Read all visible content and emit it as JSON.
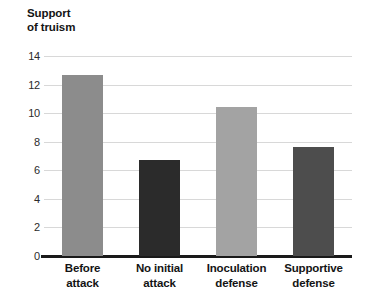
{
  "chart_data": {
    "type": "bar",
    "title": "Support\nof truism",
    "title_lines": [
      "Support",
      "of truism"
    ],
    "xlabel": "",
    "ylabel": "Support of truism",
    "categories": [
      "Before\nattack",
      "No initial\nattack",
      "Inoculation\ndefense",
      "Supportive\ndefense"
    ],
    "values": [
      12.7,
      6.7,
      10.4,
      7.6
    ],
    "bar_colors": [
      "#8c8c8c",
      "#2b2b2b",
      "#a3a3a3",
      "#4d4d4d"
    ],
    "ylim": [
      0,
      14
    ],
    "yticks": [
      0,
      2,
      4,
      6,
      8,
      10,
      12,
      14
    ],
    "ytick_labels": [
      "0",
      "2",
      "4",
      "6",
      "8",
      "10",
      "12",
      "14"
    ],
    "grid": true,
    "grid_color": "#d8d8d8",
    "axis_color": "#1a1a1a",
    "legend": null,
    "background": "#ffffff"
  }
}
